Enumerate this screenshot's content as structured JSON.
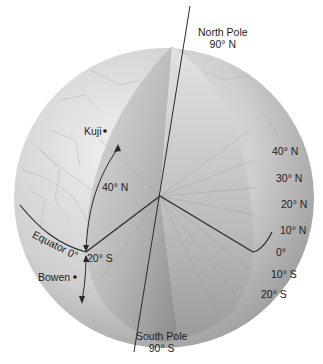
{
  "poles": {
    "north": {
      "name": "North Pole",
      "lat": "90° N"
    },
    "south": {
      "name": "South Pole",
      "lat": "90° S"
    }
  },
  "places": [
    {
      "name": "Kuji"
    },
    {
      "name": "Bowen"
    }
  ],
  "equator_label": "Equator 0°",
  "angle_labels": {
    "north": "40° N",
    "south": "20° S"
  },
  "latitude_scale": [
    "40° N",
    "30° N",
    "20° N",
    "10° N",
    "0°",
    "10° S",
    "20° S"
  ],
  "colors": {
    "globe_surface": "#c9c9c9",
    "cutaway_light": "#d8d8d8",
    "cutaway_dark": "#8f8f8f",
    "line": "#2a2a2a",
    "text": "#1e1e1e"
  }
}
